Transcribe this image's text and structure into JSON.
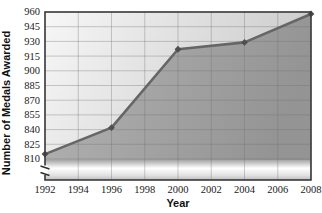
{
  "chart_data": {
    "type": "area",
    "title": "",
    "xlabel": "Year",
    "ylabel": "Number of Medals Awarded",
    "series_name": "Medals Awarded",
    "x": [
      1992,
      1996,
      2000,
      2004,
      2008
    ],
    "values": [
      815,
      842,
      922,
      929,
      958
    ],
    "x_ticks": [
      1992,
      1994,
      1996,
      1998,
      2000,
      2002,
      2004,
      2006,
      2008
    ],
    "y_ticks": [
      810,
      825,
      840,
      855,
      870,
      885,
      900,
      915,
      930,
      945,
      960
    ],
    "xlim": [
      1992,
      2008
    ],
    "ylim": [
      810,
      960
    ],
    "grid": true,
    "y_axis_break": true,
    "legend_position": "none",
    "marker_shape": "diamond",
    "colors": {
      "line": "#666666",
      "marker": "#4f4f4f",
      "area_left": "#b2b2b2",
      "area_right": "#969696",
      "plot_bg_light": "#f6f6f6",
      "plot_bg_dark": "#cccccc",
      "grid": "#6f6f6f",
      "border": "#3c3c3c",
      "tick_text": "#1a1a1a",
      "gloss_white": "#ffffff"
    }
  }
}
